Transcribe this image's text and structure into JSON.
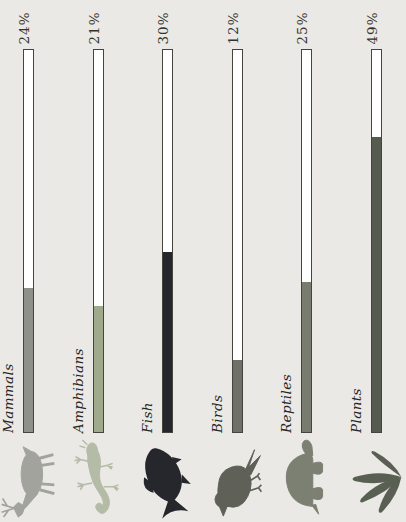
{
  "chart_data": {
    "type": "bar",
    "orientation": "horizontal, whole figure rotated 90deg counterclockwise",
    "title": "",
    "categories": [
      "Mammals",
      "Amphibians",
      "Fish",
      "Birds",
      "Reptiles",
      "Plants"
    ],
    "values": [
      24,
      21,
      30,
      12,
      25,
      49
    ],
    "value_labels": [
      "24%",
      "21%",
      "30%",
      "12%",
      "25%",
      "49%"
    ],
    "unit": "%",
    "axis_max_percent": 63.5,
    "grid": "off",
    "legend": "none",
    "bar_colors": [
      "#8e908a",
      "#9faa8c",
      "#25262b",
      "#6f7168",
      "#777c6e",
      "#565b50"
    ],
    "icon_colors": [
      "#a1a39c",
      "#b4bba7",
      "#26272c",
      "#5f6158",
      "#7b8072",
      "#5a5f54"
    ],
    "icons": [
      "deer-icon",
      "salamander-icon",
      "fish-icon",
      "bird-icon",
      "turtle-icon",
      "leaves-icon"
    ],
    "bar_track_color": "#ffffff",
    "bar_outline_color": "#45453d",
    "background_color": "#eae9e5",
    "value_text_color": "#32322b",
    "category_text_color": "#26261f"
  }
}
